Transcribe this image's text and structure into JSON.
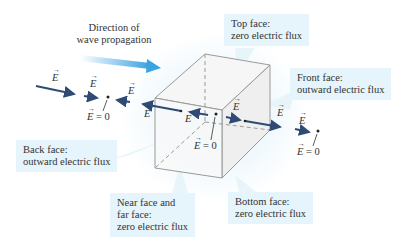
{
  "diagram": {
    "propagation_label": "Direction of wave propagation",
    "propagation_label_lines": [
      "Direction of",
      "wave propagation"
    ],
    "field_symbol": "E",
    "zero_field_label": "= 0",
    "callouts": {
      "top": {
        "line1": "Top face:",
        "line2": "zero electric flux"
      },
      "front": {
        "line1": "Front face:",
        "line2": "outward electric flux"
      },
      "back": {
        "line1": "Back face:",
        "line2": "outward electric flux"
      },
      "near_far": {
        "line1": "Near face and",
        "line2": "far face:",
        "line3": "zero electric flux"
      },
      "bottom": {
        "line1": "Bottom face:",
        "line2": "zero electric flux"
      }
    },
    "colors": {
      "callout_bg": "#e6f5fb",
      "field_arrow": "#2e4a75",
      "propagation_arrow": "#3aa3e0",
      "cube_edge": "#9a9a9a",
      "cube_face": "#f2f2f2"
    }
  }
}
